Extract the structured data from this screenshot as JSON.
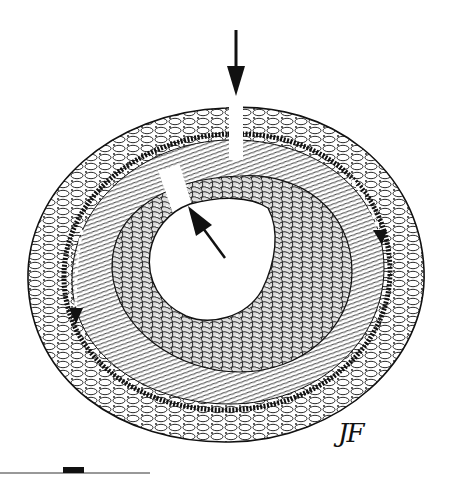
{
  "figure": {
    "signature": "JF",
    "colors": {
      "ink": "#111111",
      "background": "#ffffff"
    },
    "arrows": [
      {
        "id": "top-arrow",
        "direction": "down",
        "tip": [
          236,
          95
        ]
      },
      {
        "id": "inner-arrow",
        "direction": "up-left",
        "tip": [
          188,
          210
        ]
      },
      {
        "id": "right-dashed-arrow",
        "direction": "down",
        "tip": [
          380,
          240
        ]
      },
      {
        "id": "left-dashed-arrow",
        "direction": "down",
        "tip": [
          76,
          320
        ]
      }
    ],
    "scale_bar": {
      "x_start": 0,
      "x_end": 150,
      "y": 473,
      "block_x": [
        63,
        84
      ]
    }
  }
}
